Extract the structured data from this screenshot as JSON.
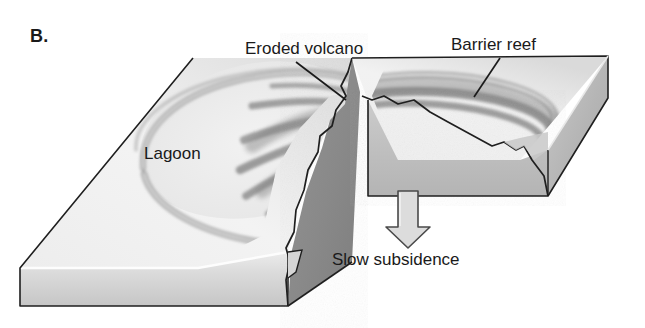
{
  "figure": {
    "panel_letter": "B.",
    "type": "block-diagram",
    "labels": {
      "eroded_volcano": "Eroded volcano",
      "barrier_reef": "Barrier reef",
      "lagoon": "Lagoon",
      "slow_subsidence": "Slow subsidence"
    },
    "icons": {
      "subsidence_arrow": "down-arrow-icon",
      "volcano_leader": "leader-line-icon",
      "reef_leader": "leader-line-icon"
    },
    "colors": {
      "background": "#ffffff",
      "top_surface_light": "#f4f4f4",
      "top_surface_shade": "#d9d9d9",
      "front_face_light": "#e2e2e2",
      "front_face_dark": "#c2c2c2",
      "right_face": "#b9b9b9",
      "cut_face_dark": "#8c8c8c",
      "cut_face_mid": "#a3a3a3",
      "reef_band": "#9a9a9a",
      "volcano_ridge": "#8f8f8f",
      "outline": "#1a1a1a",
      "arrow_fill": "#dcdcdc",
      "text": "#1a1a1a"
    }
  }
}
